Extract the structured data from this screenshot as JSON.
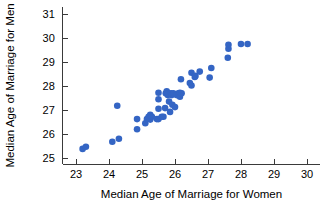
{
  "chart_data": {
    "type": "scatter",
    "title": "",
    "xlabel": "Median Age of Marriage for Women",
    "ylabel": "Median Age of Marriage for Men",
    "xlim": [
      22.6,
      30.4
    ],
    "ylim": [
      24.75,
      31.3
    ],
    "xticks": [
      23,
      24,
      25,
      26,
      27,
      28,
      29,
      30
    ],
    "xticklabels": [
      "23",
      "24",
      "25",
      "26",
      "27",
      "28",
      "29",
      "30"
    ],
    "yticks": [
      25,
      26,
      27,
      28,
      29,
      30,
      31
    ],
    "yticklabels": [
      "25",
      "26",
      "27",
      "28",
      "29",
      "30",
      "31"
    ],
    "grid": false,
    "legend": null,
    "marker": {
      "shape": "circle",
      "color": "#3465c4",
      "size": 3.3
    },
    "n_points": 51,
    "points": [
      [
        23.2,
        25.38
      ],
      [
        23.3,
        25.47
      ],
      [
        24.1,
        25.68
      ],
      [
        24.3,
        25.8
      ],
      [
        24.25,
        27.18
      ],
      [
        24.85,
        26.62
      ],
      [
        24.85,
        26.2
      ],
      [
        25.1,
        26.45
      ],
      [
        25.15,
        26.62
      ],
      [
        25.2,
        26.72
      ],
      [
        25.25,
        26.6
      ],
      [
        25.25,
        26.8
      ],
      [
        25.3,
        26.72
      ],
      [
        25.45,
        26.62
      ],
      [
        25.5,
        26.62
      ],
      [
        25.5,
        27.05
      ],
      [
        25.5,
        27.72
      ],
      [
        25.5,
        27.45
      ],
      [
        25.6,
        26.72
      ],
      [
        25.65,
        26.72
      ],
      [
        25.7,
        27.08
      ],
      [
        25.72,
        27.7
      ],
      [
        25.75,
        27.78
      ],
      [
        25.78,
        27.62
      ],
      [
        25.8,
        27.7
      ],
      [
        25.82,
        27.35
      ],
      [
        25.85,
        26.92
      ],
      [
        25.88,
        27.7
      ],
      [
        25.9,
        27.62
      ],
      [
        25.92,
        27.22
      ],
      [
        25.95,
        27.7
      ],
      [
        26.0,
        27.12
      ],
      [
        26.05,
        27.62
      ],
      [
        26.1,
        27.7
      ],
      [
        26.15,
        27.72
      ],
      [
        26.15,
        27.55
      ],
      [
        26.18,
        28.28
      ],
      [
        26.2,
        27.7
      ],
      [
        26.45,
        28.12
      ],
      [
        26.5,
        28.02
      ],
      [
        26.5,
        28.55
      ],
      [
        26.6,
        28.38
      ],
      [
        26.62,
        28.42
      ],
      [
        26.75,
        28.6
      ],
      [
        27.05,
        28.35
      ],
      [
        27.1,
        28.75
      ],
      [
        27.6,
        29.18
      ],
      [
        27.62,
        29.55
      ],
      [
        27.62,
        29.72
      ],
      [
        28.0,
        29.75
      ],
      [
        28.2,
        29.75
      ]
    ]
  },
  "axis": {
    "x_title": "Median Age of Marriage for Women",
    "y_title": "Median Age of Marriage for Men"
  }
}
